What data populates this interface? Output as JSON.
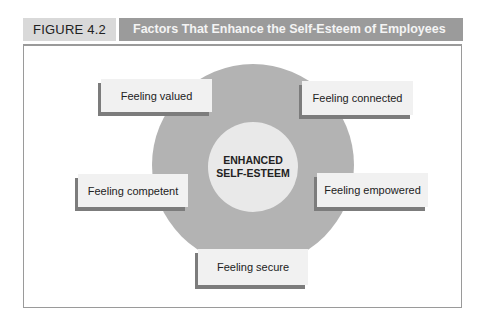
{
  "header": {
    "figure_label": "FIGURE 4.2",
    "title": "Factors That Enhance the Self-Esteem of Employees"
  },
  "diagram": {
    "center": {
      "line1": "ENHANCED",
      "line2": "SELF-ESTEEM"
    },
    "factors": [
      {
        "label": "Feeling valued",
        "position": "top-left"
      },
      {
        "label": "Feeling connected",
        "position": "top-right"
      },
      {
        "label": "Feeling competent",
        "position": "middle-left"
      },
      {
        "label": "Feeling empowered",
        "position": "middle-right"
      },
      {
        "label": "Feeling secure",
        "position": "bottom"
      }
    ]
  },
  "colors": {
    "title_bar": "#9b9b9b",
    "label_bg": "#d9d9d9",
    "outer_circle": "#b3b3b3",
    "inner_circle": "#e9e9e9",
    "box_bg": "#f1f1f1",
    "box_shadow": "#7c7c7c"
  }
}
